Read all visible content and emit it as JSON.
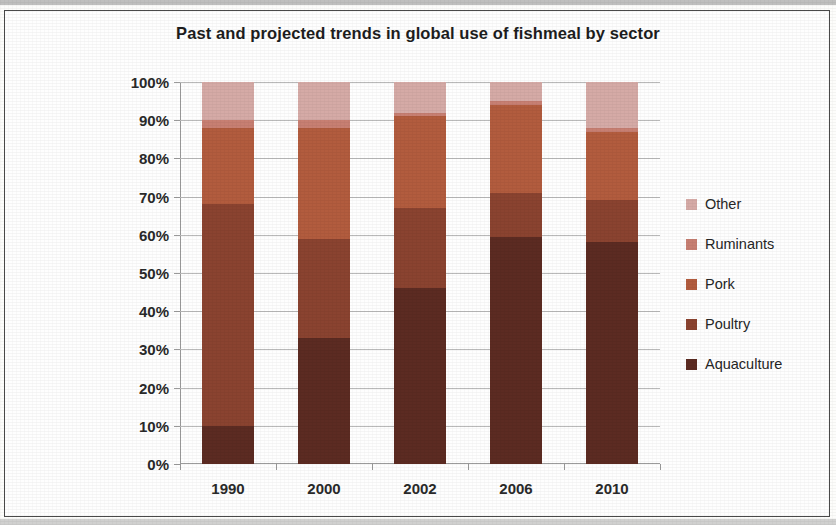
{
  "chart_data": {
    "type": "bar",
    "subtype": "stacked-100-percent",
    "title": "Past and projected trends in global use of fishmeal by sector",
    "xlabel": "",
    "ylabel": "",
    "categories": [
      "1990",
      "2000",
      "2002",
      "2006",
      "2010"
    ],
    "ylim": [
      0,
      100
    ],
    "ytick_labels": [
      "0%",
      "10%",
      "20%",
      "30%",
      "40%",
      "50%",
      "60%",
      "70%",
      "80%",
      "90%",
      "100%"
    ],
    "ytick_values": [
      0,
      10,
      20,
      30,
      40,
      50,
      60,
      70,
      80,
      90,
      100
    ],
    "grid": true,
    "legend_position": "right",
    "legend_order_top_to_bottom": [
      "Other",
      "Ruminants",
      "Pork",
      "Poultry",
      "Aquaculture"
    ],
    "stack_order_bottom_to_top": [
      "Aquaculture",
      "Poultry",
      "Pork",
      "Ruminants",
      "Other"
    ],
    "series": [
      {
        "name": "Aquaculture",
        "color": "#5c2b22",
        "values": [
          10,
          33,
          46,
          59.5,
          58
        ]
      },
      {
        "name": "Poultry",
        "color": "#8a4330",
        "values": [
          58,
          26,
          21,
          11.5,
          11
        ]
      },
      {
        "name": "Pork",
        "color": "#b25c3e",
        "values": [
          20,
          29,
          24,
          23,
          18
        ]
      },
      {
        "name": "Ruminants",
        "color": "#c77f72",
        "values": [
          2,
          2,
          1,
          1,
          1
        ]
      },
      {
        "name": "Other",
        "color": "#d5aaa6",
        "values": [
          10,
          10,
          8,
          5,
          12
        ]
      }
    ]
  }
}
